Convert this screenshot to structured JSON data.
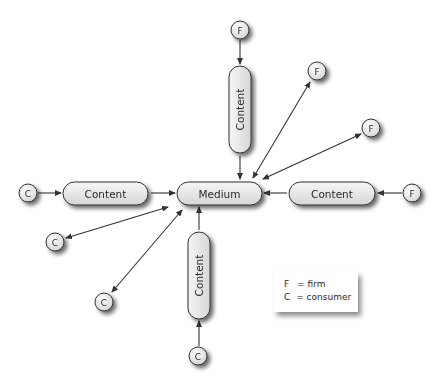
{
  "diagram": {
    "center_node": {
      "label": "Medium"
    },
    "content_nodes": {
      "top": {
        "label": "Content"
      },
      "left": {
        "label": "Content"
      },
      "right": {
        "label": "Content"
      },
      "bottom": {
        "label": "Content"
      }
    },
    "actor_nodes": {
      "top_firm": {
        "label": "F"
      },
      "upper_right_firm_1": {
        "label": "F"
      },
      "upper_right_firm_2": {
        "label": "F"
      },
      "right_firm": {
        "label": "F"
      },
      "left_consumer": {
        "label": "C"
      },
      "lower_left_consumer_1": {
        "label": "C"
      },
      "lower_left_consumer_2": {
        "label": "C"
      },
      "bottom_consumer": {
        "label": "C"
      }
    },
    "edges": [
      {
        "from": "F (top)",
        "to": "Content (top)",
        "type": "one-way"
      },
      {
        "from": "Content (top)",
        "to": "Medium",
        "type": "one-way"
      },
      {
        "from": "C (left)",
        "to": "Content (left)",
        "type": "one-way"
      },
      {
        "from": "Content (left)",
        "to": "Medium",
        "type": "one-way"
      },
      {
        "from": "F (right)",
        "to": "Content (right)",
        "type": "one-way"
      },
      {
        "from": "Content (right)",
        "to": "Medium",
        "type": "one-way"
      },
      {
        "from": "C (bottom)",
        "to": "Content (bottom)",
        "type": "one-way"
      },
      {
        "from": "Content (bottom)",
        "to": "Medium",
        "type": "one-way"
      },
      {
        "from": "Medium",
        "to": "F (upper-right 1)",
        "type": "two-way"
      },
      {
        "from": "Medium",
        "to": "F (upper-right 2)",
        "type": "two-way"
      },
      {
        "from": "Medium",
        "to": "C (lower-left 1)",
        "type": "two-way"
      },
      {
        "from": "Medium",
        "to": "C (lower-left 2)",
        "type": "two-way"
      }
    ]
  },
  "legend": {
    "items": [
      {
        "key": "F",
        "eq": "=",
        "value": "firm"
      },
      {
        "key": "C",
        "eq": "=",
        "value": "consumer"
      }
    ]
  },
  "colors": {
    "node_fill_top": "#f4f4f4",
    "node_fill_bottom": "#d8d8d8",
    "node_stroke": "#333333",
    "arrow": "#333333",
    "text": "#2a2a2a"
  }
}
